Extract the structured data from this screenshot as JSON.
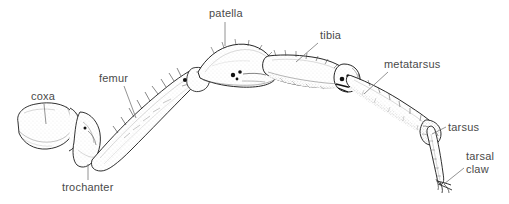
{
  "figure": {
    "style": "ink line drawing with stipple shading",
    "background_color": "#ffffff",
    "ink_color": "#1a1a1a",
    "label_color": "#4a4a4a",
    "leader_color": "#777777",
    "labels": [
      {
        "id": "coxa",
        "text": "coxa"
      },
      {
        "id": "trochanter",
        "text": "trochanter"
      },
      {
        "id": "femur",
        "text": "femur"
      },
      {
        "id": "patella",
        "text": "patella"
      },
      {
        "id": "tibia",
        "text": "tibia"
      },
      {
        "id": "metatarsus",
        "text": "metatarsus"
      },
      {
        "id": "tarsus",
        "text": "tarsus"
      },
      {
        "id": "tarsal_claw_line1",
        "text": "tarsal"
      },
      {
        "id": "tarsal_claw_line2",
        "text": "claw"
      }
    ]
  }
}
